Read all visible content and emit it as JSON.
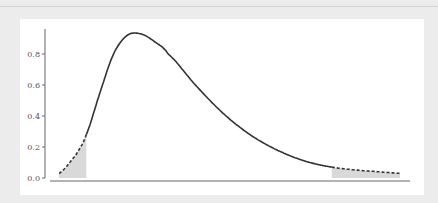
{
  "chart_data": {
    "type": "line",
    "title": "",
    "xlabel": "",
    "ylabel": "",
    "ylim": [
      0.0,
      0.95
    ],
    "y_ticks": [
      0.0,
      0.2,
      0.4,
      0.6,
      0.8
    ],
    "y_tick_labels": [
      "0.0",
      "0.2",
      "0.4",
      "0.6",
      "0.8"
    ],
    "x_ticks": [],
    "grid": false,
    "legend": null,
    "series": [
      {
        "name": "density",
        "style": "solid",
        "description": "Right-skewed probability density curve; peak ~0.93",
        "x_norm": [
          0.0,
          0.05,
          0.08,
          0.12,
          0.16,
          0.2,
          0.24,
          0.28,
          0.32,
          0.4,
          0.48,
          0.56,
          0.64,
          0.72,
          0.8,
          0.88,
          0.94,
          1.0
        ],
        "values": [
          0.03,
          0.15,
          0.28,
          0.55,
          0.8,
          0.92,
          0.93,
          0.88,
          0.8,
          0.6,
          0.42,
          0.28,
          0.18,
          0.11,
          0.07,
          0.05,
          0.04,
          0.03
        ]
      }
    ],
    "shaded_regions": [
      {
        "name": "left-tail",
        "x_norm_range": [
          0.0,
          0.08
        ],
        "style": "dashed-curve-with-gray-fill"
      },
      {
        "name": "right-tail",
        "x_norm_range": [
          0.8,
          1.0
        ],
        "style": "dashed-curve-with-gray-fill"
      }
    ],
    "colors": {
      "curve": "#333333",
      "fill": "#d9d9d9",
      "axis": "#666666",
      "background": "#ffffff",
      "frame": "#ececec"
    }
  }
}
